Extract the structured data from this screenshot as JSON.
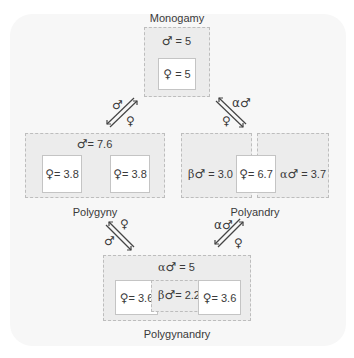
{
  "diagram": {
    "colors": {
      "panel": "#f7f7f7",
      "group_fill": "#ececec",
      "group_border": "#bdbdbd",
      "inner_fill": "#ffffff",
      "text": "#3a3a3a"
    },
    "symbols": {
      "male": "♂",
      "female": "♀",
      "alpha": "α",
      "beta": "β"
    },
    "nodes": {
      "monogamy": {
        "name": "Monogamy",
        "male": "= 5",
        "female": "= 5"
      },
      "polygyny": {
        "name": "Polygyny",
        "male": "= 7.6",
        "female_1": "= 3.8",
        "female_2": "= 3.8"
      },
      "polyandry": {
        "name": "Polyandry",
        "beta_male": "= 3.0",
        "female": "= 6.7",
        "alpha_male": "= 3.7"
      },
      "polygynandry": {
        "name": "Polygynandry",
        "alpha_male": "= 5",
        "female_1": "= 3.6",
        "beta_male": "= 2.2",
        "female_2": "= 3.6"
      }
    },
    "transitions": [
      {
        "from": "monogamy",
        "to": "polygyny",
        "upper_label": "♂",
        "lower_label": "♀"
      },
      {
        "from": "monogamy",
        "to": "polyandry",
        "upper_label": "α♂",
        "lower_label": "♀"
      },
      {
        "from": "polygyny",
        "to": "polygynandry",
        "upper_label": "♀",
        "lower_label": "♂"
      },
      {
        "from": "polyandry",
        "to": "polygynandry",
        "upper_label": "α♂",
        "lower_label": "♀"
      }
    ]
  }
}
